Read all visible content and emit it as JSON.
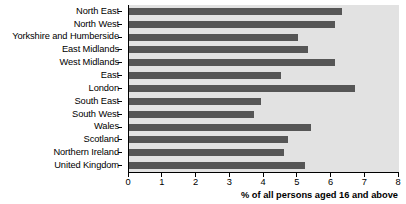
{
  "chart_data": {
    "type": "bar",
    "orientation": "horizontal",
    "title": "",
    "subtitle": "",
    "xlabel": "% of all persons aged 16 and above",
    "ylabel": "",
    "xlim": [
      0,
      8
    ],
    "xticks": [
      0,
      1,
      2,
      3,
      4,
      5,
      6,
      7,
      8
    ],
    "xtick_labels": [
      "0",
      "1",
      "2",
      "3",
      "4",
      "5",
      "6",
      "7",
      "8"
    ],
    "grid": false,
    "legend": false,
    "categories": [
      "North East",
      "North West",
      "Yorkshire and Humberside",
      "East Midlands",
      "West Midlands",
      "East",
      "London",
      "South East",
      "South West",
      "Wales",
      "Scotland",
      "Northern Ireland",
      "United Kingdom"
    ],
    "values": [
      6.3,
      6.1,
      5.0,
      5.3,
      6.1,
      4.5,
      6.7,
      3.9,
      3.7,
      5.4,
      4.7,
      4.6,
      5.2
    ],
    "bar_color": "#565656",
    "plot_background": "#e2e2e2"
  }
}
